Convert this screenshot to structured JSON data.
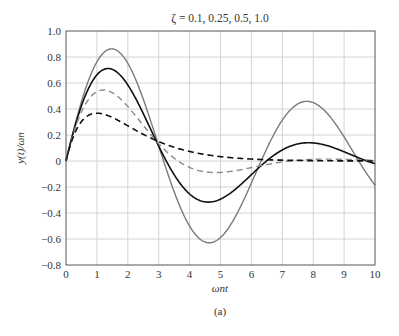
{
  "chart_data": {
    "type": "line",
    "title": "ζ = 0.1, 0.25, 0.5, 1.0",
    "xlabel": "ωnt",
    "ylabel": "y(t)/ωn",
    "caption": "(a)",
    "xlim": [
      0,
      10
    ],
    "ylim": [
      -0.8,
      1.0
    ],
    "xticks": [
      "0",
      "1",
      "2",
      "3",
      "4",
      "5",
      "6",
      "7",
      "8",
      "9",
      "10"
    ],
    "yticks": [
      "1.0",
      "0.8",
      "0.6",
      "0.4",
      "0.2",
      "0",
      "−0.2",
      "−0.4",
      "−0.6",
      "−0.8"
    ],
    "grid": true,
    "legend": "none",
    "x": [
      0,
      0.5,
      1,
      1.5,
      2,
      2.5,
      3,
      3.5,
      4,
      4.5,
      5,
      5.5,
      6,
      6.5,
      7,
      7.5,
      8,
      8.5,
      9,
      9.5,
      10
    ],
    "series": [
      {
        "name": "ζ = 0.1",
        "zeta": 0.1,
        "color": "#7a7a7a",
        "dash": "solid",
        "values": [
          0,
          0.456,
          0.761,
          0.853,
          0.745,
          0.498,
          0.18,
          -0.117,
          -0.391,
          -0.557,
          -0.594,
          -0.522,
          -0.37,
          -0.176,
          0.019,
          0.183,
          0.291,
          0.329,
          0.299,
          0.215,
          0.101
        ]
      },
      {
        "name": "ζ = 0.25",
        "zeta": 0.25,
        "color": "#111111",
        "dash": "solid",
        "values": [
          0,
          0.427,
          0.66,
          0.701,
          0.584,
          0.366,
          0.12,
          -0.087,
          -0.222,
          -0.284,
          -0.276,
          -0.214,
          -0.129,
          -0.043,
          0.027,
          0.072,
          0.091,
          0.087,
          0.069,
          0.042,
          0.015
        ]
      },
      {
        "name": "ζ = 0.5",
        "zeta": 0.5,
        "color": "#8a8a8a",
        "dash": "dashed",
        "values": [
          0,
          0.364,
          0.529,
          0.541,
          0.449,
          0.301,
          0.157,
          0.031,
          -0.047,
          -0.085,
          -0.094,
          -0.083,
          -0.063,
          -0.04,
          -0.02,
          -0.004,
          0.006,
          0.01,
          0.01,
          0.008,
          0.006
        ]
      },
      {
        "name": "ζ = 1.0",
        "zeta": 1.0,
        "color": "#111111",
        "dash": "dashed",
        "values": [
          0,
          0.303,
          0.368,
          0.335,
          0.271,
          0.205,
          0.149,
          0.106,
          0.073,
          0.05,
          0.034,
          0.022,
          0.015,
          0.01,
          0.006,
          0.004,
          0.003,
          0.002,
          0.001,
          0.001,
          0.0
        ]
      }
    ]
  }
}
